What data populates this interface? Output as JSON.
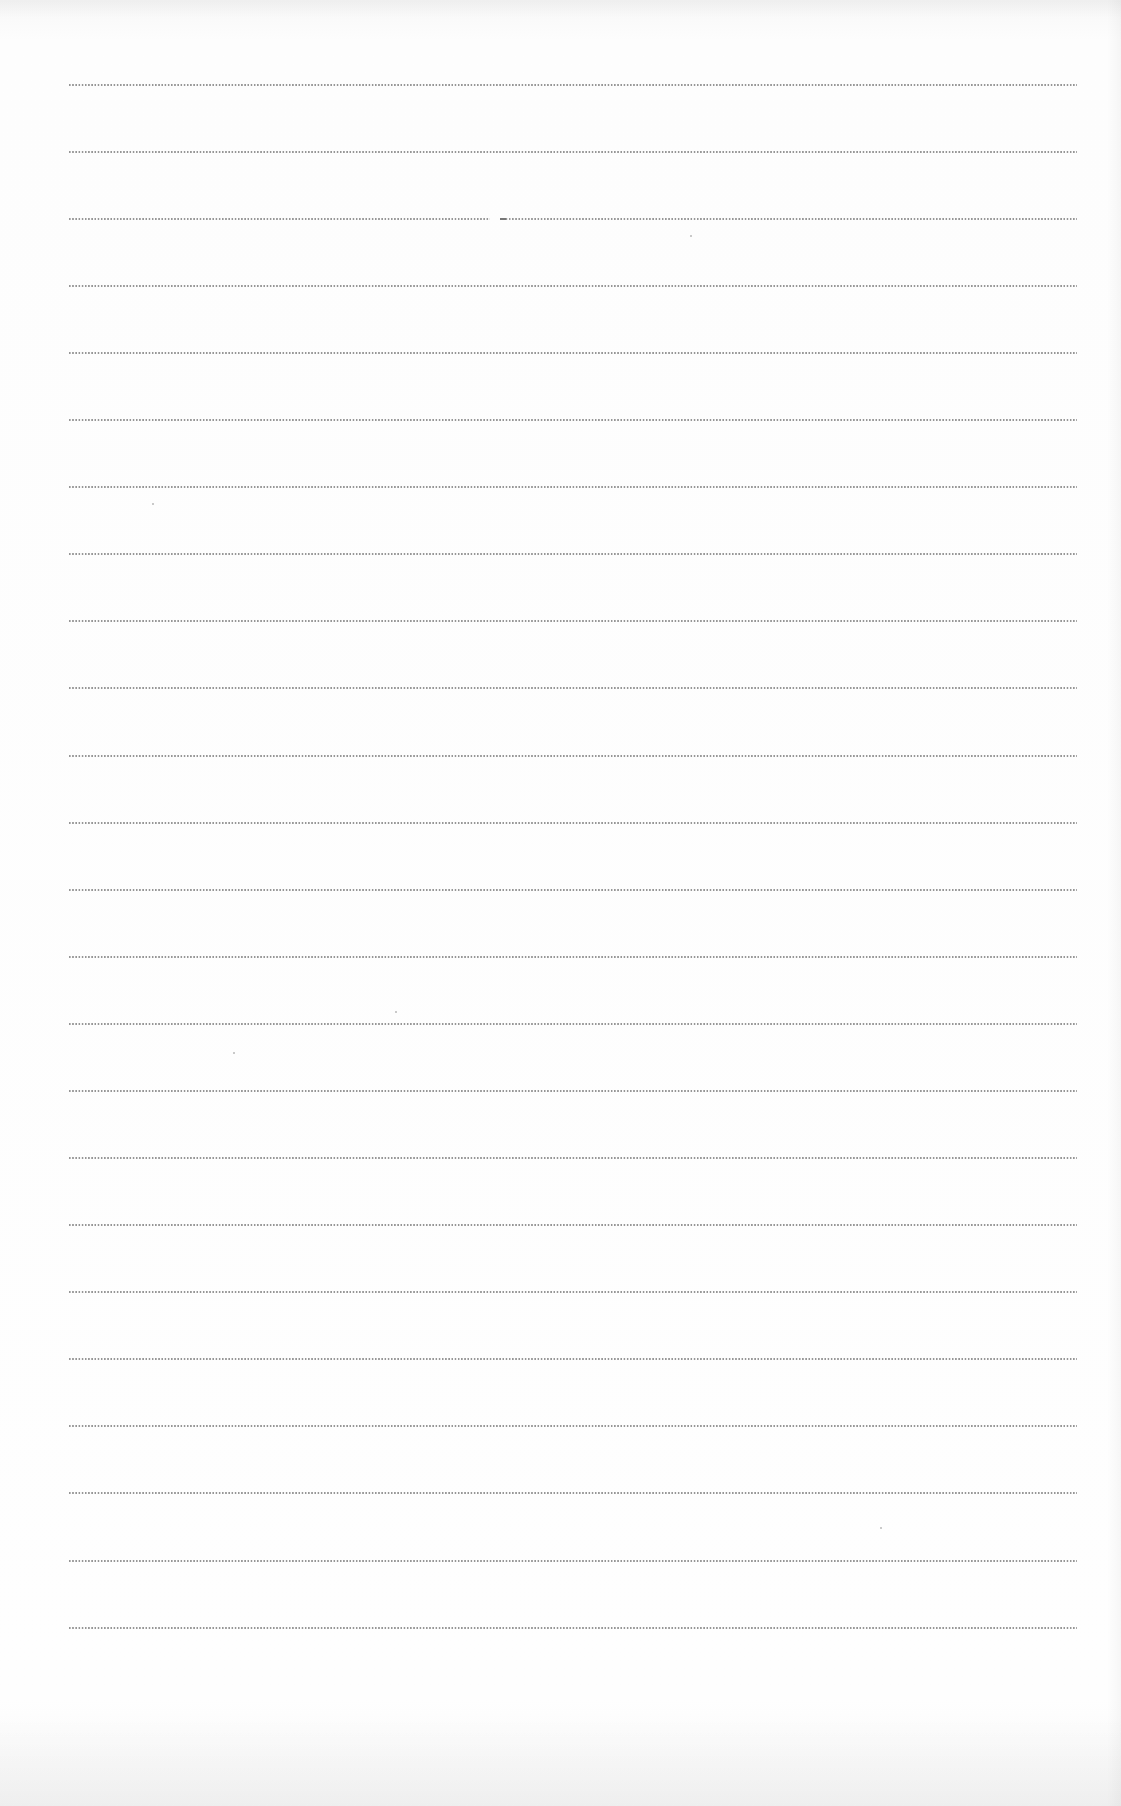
{
  "document": {
    "type": "blank lined writing sheet",
    "background_color": "#fdfdfd",
    "rule_color": "#8a8a8a",
    "rule_style": "dotted",
    "rule_count": 24,
    "rule_left_px": 69,
    "rule_right_px": 1077,
    "first_rule_y_px": 84,
    "rule_spacing_px": 67.1,
    "rules": [
      {
        "index": 1,
        "y": 84
      },
      {
        "index": 2,
        "y": 151
      },
      {
        "index": 3,
        "y": 218,
        "gap": [
          490,
          500
        ]
      },
      {
        "index": 4,
        "y": 285
      },
      {
        "index": 5,
        "y": 352
      },
      {
        "index": 6,
        "y": 419
      },
      {
        "index": 7,
        "y": 486
      },
      {
        "index": 8,
        "y": 553
      },
      {
        "index": 9,
        "y": 620
      },
      {
        "index": 10,
        "y": 687
      },
      {
        "index": 11,
        "y": 755
      },
      {
        "index": 12,
        "y": 822
      },
      {
        "index": 13,
        "y": 889
      },
      {
        "index": 14,
        "y": 956
      },
      {
        "index": 15,
        "y": 1023
      },
      {
        "index": 16,
        "y": 1090
      },
      {
        "index": 17,
        "y": 1157
      },
      {
        "index": 18,
        "y": 1224
      },
      {
        "index": 19,
        "y": 1291
      },
      {
        "index": 20,
        "y": 1358
      },
      {
        "index": 21,
        "y": 1425
      },
      {
        "index": 22,
        "y": 1492
      },
      {
        "index": 23,
        "y": 1560
      },
      {
        "index": 24,
        "y": 1627
      }
    ],
    "specks": [
      {
        "x": 395,
        "y": 1011
      },
      {
        "x": 233,
        "y": 1052
      },
      {
        "x": 152,
        "y": 503
      },
      {
        "x": 690,
        "y": 235
      },
      {
        "x": 880,
        "y": 1527
      }
    ]
  }
}
